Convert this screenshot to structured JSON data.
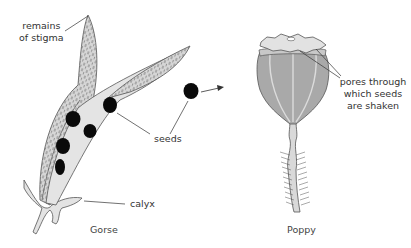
{
  "diagram": {
    "type": "botanical-illustration",
    "figures": [
      {
        "name": "Gorse",
        "caption": "Gorse",
        "labels": {
          "stigma": [
            "remains",
            "of stigma"
          ],
          "seeds": "seeds",
          "calyx": "calyx"
        }
      },
      {
        "name": "Poppy",
        "caption": "Poppy",
        "labels": {
          "pores": [
            "pores through",
            "which seeds",
            "are shaken"
          ]
        }
      }
    ],
    "colors": {
      "pod_fill": "#d9d9d9",
      "capsule_fill": "#a9a9a9",
      "capsule_ribs": "#dcdcdc",
      "seed": "#0a0a0a",
      "outline": "#444444"
    }
  }
}
